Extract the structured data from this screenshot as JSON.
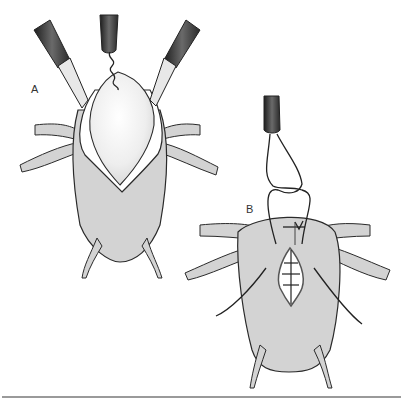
{
  "figure": {
    "panels": [
      {
        "id": "A",
        "label": "A",
        "description": "Organ held open by two graspers with a corkscrew instrument lifting the white inner mass through an elliptical opening"
      },
      {
        "id": "B",
        "label": "B",
        "description": "Opening closed with sutures; a knot-pusher instrument ties a suture loop above the closure"
      }
    ],
    "colors": {
      "organ_fill": "#d3d3d3",
      "outline": "#2a2a2a",
      "mass_fill": "#f2f2f2",
      "instrument_dark": "#3a3a3a",
      "rule": "#9a9a9a"
    }
  }
}
